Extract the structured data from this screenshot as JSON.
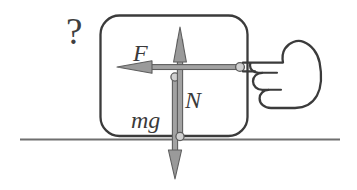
{
  "figure": {
    "kind": "free-body-diagram",
    "width": 357,
    "height": 190,
    "background_color": "#ffffff"
  },
  "annotations": {
    "question_mark": "?",
    "force_applied_label": "F",
    "normal_force_label": "N",
    "weight_label": "mg"
  },
  "colors": {
    "box_stroke": "#3b3b3b",
    "ground_stroke": "#6f6f6f",
    "arrow_fill": "#9a9a9a",
    "arrow_stroke": "#5d5d5d",
    "hand_stroke": "#3b3b3b",
    "label_color": "#3a3a3a",
    "question_color": "#3f3f3f"
  },
  "vectors": [
    {
      "name": "applied-force",
      "label": "F",
      "direction": "left",
      "orientation": "horizontal",
      "tail_x": 240,
      "tail_y": 67,
      "tip_x": 117,
      "tip_y": 67,
      "has_tail_dot": true
    },
    {
      "name": "normal-force",
      "label": "N",
      "direction": "up",
      "orientation": "vertical",
      "tail_x": 180,
      "tail_y": 137,
      "tip_x": 180,
      "tip_y": 27,
      "has_tail_dot": true
    },
    {
      "name": "weight-force",
      "label": "mg",
      "direction": "down",
      "orientation": "vertical",
      "tail_x": 175,
      "tail_y": 77,
      "tip_x": 175,
      "tip_y": 179,
      "has_tail_dot": true
    }
  ],
  "block": {
    "name": "block-body",
    "x": 100,
    "y": 15,
    "width": 148,
    "height": 121,
    "corner_radius": 19
  },
  "ground": {
    "name": "ground-surface",
    "x_start": 20,
    "x_end": 340,
    "y": 139
  },
  "hand": {
    "name": "pointing-hand",
    "direction": "pointing-left",
    "contact_x": 240,
    "contact_y": 67
  }
}
